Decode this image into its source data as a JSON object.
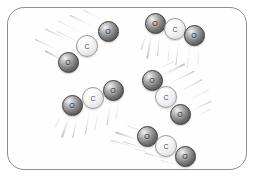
{
  "scene": {
    "title": "Carbon dioxide gas molecules in motion",
    "background_color": "#ffffff",
    "frame": {
      "name": "container-frame",
      "border_color": "#8d8d92",
      "fill_color": "#fefefe",
      "corner_radius": "17px"
    }
  },
  "legend": {
    "atom_types": [
      {
        "symbol": "O",
        "name": "oxygen",
        "shade": "dark",
        "color": "#5c5c5c"
      },
      {
        "symbol": "C",
        "name": "carbon",
        "shade": "light",
        "color": "#f0f0f0"
      }
    ]
  },
  "molecules": [
    {
      "id": "molecule-1",
      "formula": "CO2",
      "position": "upper-left",
      "motion_direction": "up-right",
      "atoms": [
        {
          "symbol": "O",
          "type": "o",
          "x": 68,
          "y": 62
        },
        {
          "symbol": "C",
          "type": "c",
          "x": 87,
          "y": 46
        },
        {
          "symbol": "O",
          "type": "o",
          "x": 108,
          "y": 31
        }
      ],
      "trails": [
        {
          "x": 68,
          "y": 62,
          "length": 26,
          "angle": 208,
          "weight": "thick"
        },
        {
          "x": 62,
          "y": 52,
          "length": 30,
          "angle": 206,
          "weight": "normal"
        },
        {
          "x": 74,
          "y": 42,
          "length": 32,
          "angle": 205,
          "weight": "normal"
        },
        {
          "x": 85,
          "y": 34,
          "length": 30,
          "angle": 207,
          "weight": "soft"
        },
        {
          "x": 95,
          "y": 27,
          "length": 28,
          "angle": 206,
          "weight": "normal"
        },
        {
          "x": 105,
          "y": 21,
          "length": 24,
          "angle": 208,
          "weight": "soft"
        },
        {
          "x": 88,
          "y": 46,
          "length": 34,
          "angle": 206,
          "weight": "soft"
        }
      ]
    },
    {
      "id": "molecule-2",
      "formula": "CO2",
      "position": "upper-right",
      "motion_direction": "up",
      "atoms": [
        {
          "symbol": "O",
          "type": "o",
          "x": 155,
          "y": 23
        },
        {
          "symbol": "C",
          "type": "c",
          "x": 175,
          "y": 29
        },
        {
          "symbol": "O",
          "type": "o",
          "x": 194,
          "y": 35
        }
      ],
      "trails": [
        {
          "x": 152,
          "y": 30,
          "length": 28,
          "angle": 100,
          "weight": "thick"
        },
        {
          "x": 160,
          "y": 32,
          "length": 24,
          "angle": 96,
          "weight": "normal"
        },
        {
          "x": 170,
          "y": 38,
          "length": 22,
          "angle": 95,
          "weight": "soft"
        },
        {
          "x": 179,
          "y": 39,
          "length": 26,
          "angle": 97,
          "weight": "normal"
        },
        {
          "x": 190,
          "y": 44,
          "length": 24,
          "angle": 96,
          "weight": "soft"
        },
        {
          "x": 148,
          "y": 28,
          "length": 22,
          "angle": 108,
          "weight": "normal"
        },
        {
          "x": 199,
          "y": 45,
          "length": 18,
          "angle": 94,
          "weight": "soft"
        }
      ]
    },
    {
      "id": "molecule-3",
      "formula": "CO2",
      "position": "middle-left",
      "motion_direction": "up-right",
      "atoms": [
        {
          "symbol": "O",
          "type": "o",
          "x": 72,
          "y": 105
        },
        {
          "symbol": "C",
          "type": "c",
          "x": 93,
          "y": 98
        },
        {
          "symbol": "O",
          "type": "o",
          "x": 113,
          "y": 90
        }
      ],
      "trails": [
        {
          "x": 70,
          "y": 112,
          "length": 26,
          "angle": 108,
          "weight": "thick"
        },
        {
          "x": 78,
          "y": 114,
          "length": 24,
          "angle": 103,
          "weight": "normal"
        },
        {
          "x": 90,
          "y": 108,
          "length": 26,
          "angle": 100,
          "weight": "normal"
        },
        {
          "x": 99,
          "y": 106,
          "length": 24,
          "angle": 100,
          "weight": "soft"
        },
        {
          "x": 111,
          "y": 99,
          "length": 26,
          "angle": 99,
          "weight": "normal"
        },
        {
          "x": 119,
          "y": 97,
          "length": 22,
          "angle": 98,
          "weight": "soft"
        },
        {
          "x": 64,
          "y": 108,
          "length": 20,
          "angle": 115,
          "weight": "soft"
        }
      ]
    },
    {
      "id": "molecule-4",
      "formula": "CO2",
      "position": "middle-right",
      "motion_direction": "down-left",
      "atoms": [
        {
          "symbol": "O",
          "type": "o",
          "x": 152,
          "y": 80
        },
        {
          "symbol": "C",
          "type": "c",
          "x": 166,
          "y": 97
        },
        {
          "symbol": "O",
          "type": "o",
          "x": 180,
          "y": 114
        }
      ],
      "trails": [
        {
          "x": 158,
          "y": 76,
          "length": 30,
          "angle": 334,
          "weight": "thick"
        },
        {
          "x": 164,
          "y": 86,
          "length": 34,
          "angle": 333,
          "weight": "normal"
        },
        {
          "x": 174,
          "y": 94,
          "length": 32,
          "angle": 332,
          "weight": "normal"
        },
        {
          "x": 182,
          "y": 103,
          "length": 30,
          "angle": 333,
          "weight": "soft"
        },
        {
          "x": 188,
          "y": 112,
          "length": 26,
          "angle": 334,
          "weight": "normal"
        },
        {
          "x": 152,
          "y": 71,
          "length": 24,
          "angle": 336,
          "weight": "soft"
        },
        {
          "x": 193,
          "y": 118,
          "length": 20,
          "angle": 332,
          "weight": "soft"
        }
      ]
    },
    {
      "id": "molecule-5",
      "formula": "CO2",
      "position": "bottom-center",
      "motion_direction": "up-right",
      "atoms": [
        {
          "symbol": "O",
          "type": "o",
          "x": 147,
          "y": 136
        },
        {
          "symbol": "C",
          "type": "c",
          "x": 166,
          "y": 146
        },
        {
          "symbol": "O",
          "type": "o",
          "x": 185,
          "y": 156
        }
      ],
      "trails": [
        {
          "x": 142,
          "y": 140,
          "length": 28,
          "angle": 198,
          "weight": "thick"
        },
        {
          "x": 136,
          "y": 147,
          "length": 26,
          "angle": 196,
          "weight": "normal"
        },
        {
          "x": 152,
          "y": 150,
          "length": 30,
          "angle": 197,
          "weight": "normal"
        },
        {
          "x": 162,
          "y": 156,
          "length": 28,
          "angle": 196,
          "weight": "soft"
        },
        {
          "x": 174,
          "y": 161,
          "length": 30,
          "angle": 196,
          "weight": "normal"
        },
        {
          "x": 184,
          "y": 166,
          "length": 24,
          "angle": 195,
          "weight": "soft"
        },
        {
          "x": 148,
          "y": 133,
          "length": 22,
          "angle": 200,
          "weight": "soft"
        }
      ]
    }
  ]
}
